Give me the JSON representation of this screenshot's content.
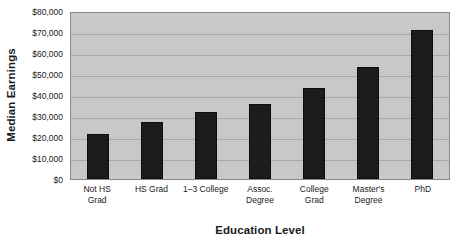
{
  "chart_data": {
    "type": "bar",
    "title": "",
    "xlabel": "Education Level",
    "ylabel": "Median Earnings",
    "categories": [
      "Not HS Grad",
      "HS Grad",
      "1–3 College",
      "Assoc. Degree",
      "College Grad",
      "Master's Degree",
      "PhD"
    ],
    "category_lines": [
      [
        "Not HS",
        "Grad"
      ],
      [
        "HS Grad",
        ""
      ],
      [
        "1–3 College",
        ""
      ],
      [
        "Assoc.",
        "Degree"
      ],
      [
        "College",
        "Grad"
      ],
      [
        "Master's",
        "Degree"
      ],
      [
        "PhD",
        ""
      ]
    ],
    "values": [
      21500,
      27000,
      32000,
      35500,
      43500,
      53500,
      71000
    ],
    "ylim": [
      0,
      80000
    ],
    "ytick_step": 10000,
    "ytick_labels": [
      "$80,000",
      "$70,000",
      "$60,000",
      "$50,000",
      "$40,000",
      "$30,000",
      "$20,000",
      "$10,000",
      "$0"
    ],
    "ytick_values": [
      80000,
      70000,
      60000,
      50000,
      40000,
      30000,
      20000,
      10000,
      0
    ],
    "grid": true,
    "grid_axis": "y",
    "legend": false,
    "colors": {
      "bar_fill": "#1c1c1c",
      "bar_edge": "#0d0d0d",
      "plot_background": "#c8c8c8",
      "gridline": "#a8a8a8",
      "plot_border": "#8a8a8a",
      "text": "#1a1a1a",
      "figure_background": "#ffffff"
    }
  }
}
